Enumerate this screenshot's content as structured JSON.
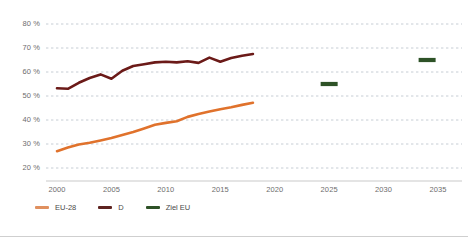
{
  "chart_data": {
    "type": "line",
    "title": "",
    "xlabel": "",
    "ylabel": "",
    "xlim": [
      1999,
      2036
    ],
    "ylim": [
      18,
      82
    ],
    "grid": true,
    "grid_style": "dashed-horizontal",
    "legend_position": "bottom-left",
    "y_ticks": [
      20,
      30,
      40,
      50,
      60,
      70,
      80
    ],
    "y_tick_labels": [
      "20 %",
      "30 %",
      "40 %",
      "50 %",
      "60 %",
      "70 %",
      "80 %"
    ],
    "x_ticks": [
      2000,
      2005,
      2010,
      2015,
      2020,
      2025,
      2030,
      2035
    ],
    "x_tick_labels": [
      "2000",
      "2005",
      "2010",
      "2015",
      "2020",
      "2025",
      "2030",
      "2035"
    ],
    "series": [
      {
        "name": "EU-28",
        "color": "#E0722C",
        "type": "line",
        "x": [
          2000,
          2001,
          2002,
          2003,
          2004,
          2005,
          2006,
          2007,
          2008,
          2009,
          2010,
          2011,
          2012,
          2013,
          2014,
          2015,
          2016,
          2017,
          2018
        ],
        "values": [
          27.0,
          28.5,
          29.8,
          30.5,
          31.5,
          32.5,
          33.8,
          35.0,
          36.5,
          38.0,
          38.8,
          39.5,
          41.3,
          42.5,
          43.5,
          44.5,
          45.3,
          46.3,
          47.2
        ]
      },
      {
        "name": "D",
        "color": "#6B1A18",
        "type": "line",
        "x": [
          2000,
          2001,
          2002,
          2003,
          2004,
          2005,
          2006,
          2007,
          2008,
          2009,
          2010,
          2011,
          2012,
          2013,
          2014,
          2015,
          2016,
          2017,
          2018
        ],
        "values": [
          53.2,
          53.0,
          55.5,
          57.5,
          59.0,
          57.2,
          60.5,
          62.5,
          63.2,
          64.0,
          64.3,
          64.0,
          64.5,
          63.8,
          66.0,
          64.3,
          65.8,
          66.8,
          67.5
        ]
      },
      {
        "name": "Ziel EU",
        "color": "#2E5227",
        "type": "marker",
        "x": [
          2025,
          2034
        ],
        "values": [
          55.0,
          65.0
        ]
      }
    ]
  },
  "legend": {
    "items": [
      {
        "label": "EU-28",
        "color": "#E0905F"
      },
      {
        "label": "D",
        "color": "#5E2320"
      },
      {
        "label": "Ziel EU",
        "color": "#2E5227"
      }
    ]
  }
}
